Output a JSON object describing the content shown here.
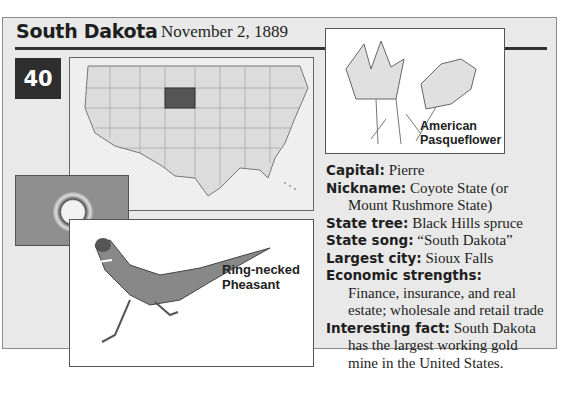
{
  "state": {
    "name": "South Dakota",
    "statehood_date": "November 2, 1889",
    "order_number": "40"
  },
  "images": {
    "map": "US map with South Dakota highlighted",
    "flag": "South Dakota state flag",
    "flower": {
      "caption_line1": "American",
      "caption_line2": "Pasqueflower"
    },
    "bird": {
      "caption_line1": "Ring-necked",
      "caption_line2": "Pheasant"
    }
  },
  "facts": {
    "capital": {
      "label": "Capital:",
      "value": "Pierre"
    },
    "nickname": {
      "label": "Nickname:",
      "value_line1": "Coyote State (or",
      "value_line2": "Mount Rushmore State)"
    },
    "state_tree": {
      "label": "State tree:",
      "value": "Black Hills spruce"
    },
    "state_song": {
      "label": "State song:",
      "value": "“South Dakota”"
    },
    "largest_city": {
      "label": "Largest city:",
      "value": "Sioux Falls"
    },
    "economic_strengths": {
      "label": "Economic strengths:",
      "value_line1": "Finance, insurance, and real",
      "value_line2": "estate; wholesale and retail trade"
    },
    "interesting_fact": {
      "label": "Interesting fact:",
      "value_line1": "South Dakota",
      "value_line2": "has the largest working gold",
      "value_line3": "mine in the United States."
    }
  }
}
